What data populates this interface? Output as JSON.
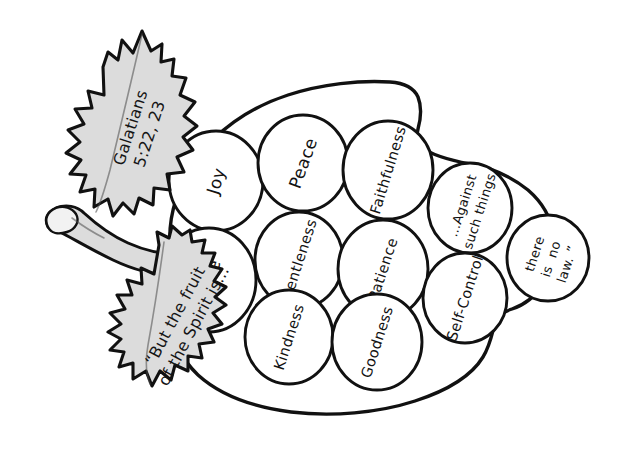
{
  "page": {
    "title": "Fruit of the Spirit",
    "background_color": "#ffffff",
    "ink_color": "#111111",
    "leaf_fill_color": "#dcdcdc",
    "grape_fill_color": "#ffffff",
    "style": "hand-drawn black-and-white coloring page"
  },
  "leaves": {
    "upper": {
      "name": "upper-leaf",
      "line1": "Galatians",
      "line2": "5:22, 23",
      "rotation_deg": -72
    },
    "lower": {
      "name": "lower-leaf",
      "line1": "“But the fruit",
      "line2": "of the Spirit is…",
      "rotation_deg": -62
    }
  },
  "stem": {
    "name": "grape-stem",
    "label": "stem"
  },
  "grapes": [
    {
      "id": "joy",
      "label": "Joy",
      "cx": 216,
      "cy": 181,
      "rx": 47,
      "ry": 50,
      "rot": -73,
      "size": "normal"
    },
    {
      "id": "peace",
      "label": "Peace",
      "cx": 303,
      "cy": 163,
      "rx": 45,
      "ry": 48,
      "rot": -70,
      "size": "normal"
    },
    {
      "id": "faithfulness",
      "label": "Faithfulness",
      "cx": 388,
      "cy": 170,
      "rx": 45,
      "ry": 49,
      "rot": -73,
      "size": "normal"
    },
    {
      "id": "love",
      "label": "Love",
      "cx": 209,
      "cy": 280,
      "rx": 47,
      "ry": 52,
      "rot": -73,
      "size": "normal"
    },
    {
      "id": "gentleness",
      "label": "Gentleness",
      "cx": 299,
      "cy": 260,
      "rx": 44,
      "ry": 48,
      "rot": -72,
      "size": "normal"
    },
    {
      "id": "patience",
      "label": "Patience",
      "cx": 383,
      "cy": 269,
      "rx": 45,
      "ry": 49,
      "rot": -72,
      "size": "normal"
    },
    {
      "id": "kindness",
      "label": "Kindness",
      "cx": 289,
      "cy": 337,
      "rx": 44,
      "ry": 47,
      "rot": -72,
      "size": "normal"
    },
    {
      "id": "goodness",
      "label": "Goodness",
      "cx": 377,
      "cy": 342,
      "rx": 45,
      "ry": 48,
      "rot": -72,
      "size": "normal"
    },
    {
      "id": "against",
      "label": "…Against",
      "label2": "such things",
      "cx": 470,
      "cy": 208,
      "rx": 42,
      "ry": 45,
      "rot": -72,
      "size": "small"
    },
    {
      "id": "self-control",
      "label": "Self-Control",
      "cx": 465,
      "cy": 298,
      "rx": 42,
      "ry": 45,
      "rot": -72,
      "size": "small"
    },
    {
      "id": "no-law",
      "label": "there",
      "label2": "is  no",
      "label3": "law. ”",
      "cx": 548,
      "cy": 258,
      "rx": 41,
      "ry": 43,
      "rot": -72,
      "size": "tiny"
    }
  ]
}
